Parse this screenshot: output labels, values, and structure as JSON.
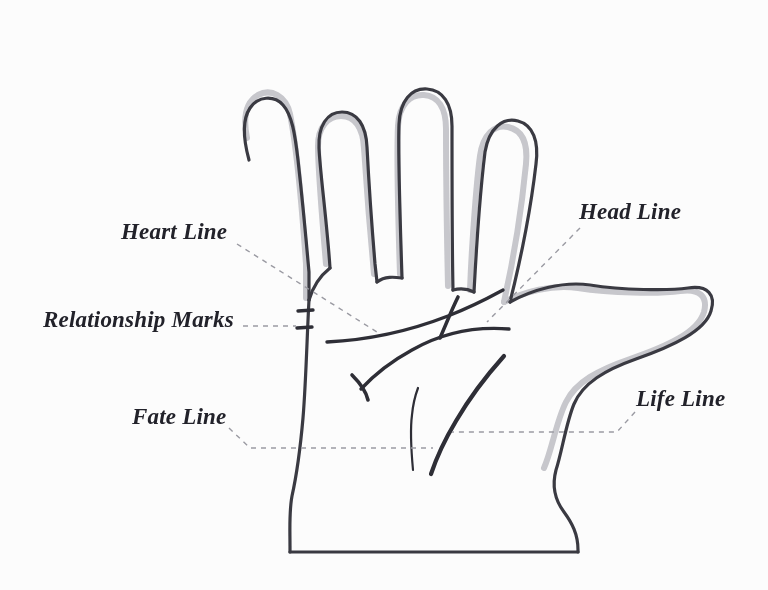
{
  "figure": {
    "kind": "palmistry-hand-diagram",
    "background_color": "#fcfcfc",
    "outline_color": "#3a3a42",
    "outline_shadow_color": "#b9b9bf",
    "palm_line_color": "#2e2e36",
    "leader_line_color": "#9a9aa2",
    "label_color": "#22222a"
  },
  "labels": [
    {
      "id": "heart-line",
      "text": "Heart Line",
      "position": "upper-left",
      "leader": "dashed diagonal to palm heart line"
    },
    {
      "id": "head-line",
      "text": "Head Line",
      "position": "upper-right",
      "leader": "dashed diagonal to palm head line"
    },
    {
      "id": "relationship-marks",
      "text": "Relationship Marks",
      "position": "mid-left",
      "leader": "dashed horizontal to two tick marks on hand edge"
    },
    {
      "id": "fate-line",
      "text": "Fate Line",
      "position": "lower-left",
      "leader": "dashed horizontal to palm fate line"
    },
    {
      "id": "life-line",
      "text": "Life Line",
      "position": "lower-right",
      "leader": "dashed horizontal to palm life line"
    }
  ],
  "hand_features": {
    "fingers": [
      "pinky",
      "ring",
      "middle",
      "index"
    ],
    "thumb": "extends to the right",
    "wrist": "flat bottom edge",
    "palm_lines": [
      "heart line",
      "head line",
      "life line",
      "fate line",
      "relationship marks"
    ]
  }
}
